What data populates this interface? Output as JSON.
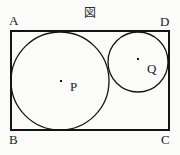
{
  "figure": {
    "caption_mark": "図",
    "background_color": "#fbfbfa",
    "stroke_color": "#141414",
    "rectangle": {
      "name": "ABCD",
      "x": 11,
      "y": 31,
      "width": 158,
      "height": 99,
      "stroke_width": 1.4
    },
    "vertex_labels": [
      {
        "id": "A",
        "text": "A",
        "position": "top-left"
      },
      {
        "id": "D",
        "text": "D",
        "position": "top-right"
      },
      {
        "id": "B",
        "text": "B",
        "position": "bottom-left"
      },
      {
        "id": "C",
        "text": "C",
        "position": "bottom-right"
      }
    ],
    "circles": [
      {
        "id": "P",
        "label": "P",
        "cx": 60,
        "cy": 81,
        "r": 49,
        "stroke_width": 1.3,
        "center_dot": {
          "x": 61,
          "y": 81,
          "size": 2
        },
        "tangencies": [
          "AB",
          "BC",
          "AD"
        ]
      },
      {
        "id": "Q",
        "label": "Q",
        "cx": 138,
        "cy": 62,
        "r": 30,
        "stroke_width": 1.3,
        "center_dot": {
          "x": 138,
          "y": 59,
          "size": 2
        },
        "tangencies": [
          "AD",
          "DC",
          "circle-P"
        ]
      }
    ]
  }
}
